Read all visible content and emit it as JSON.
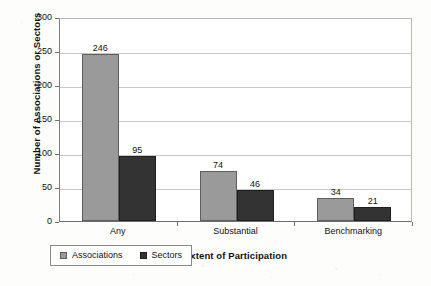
{
  "chart_data": {
    "type": "bar",
    "title": "",
    "categories": [
      "Any",
      "Substantial",
      "Benchmarking"
    ],
    "series": [
      {
        "name": "Associations",
        "values": [
          246,
          74,
          34
        ],
        "color": "#9a9a9a"
      },
      {
        "name": "Sectors",
        "values": [
          95,
          46,
          21
        ],
        "color": "#333333"
      }
    ],
    "xlabel": "Extent of Participation",
    "ylabel": "Number of Associations or Sectors",
    "ylim": [
      0,
      300
    ],
    "ytick_labels": [
      "0",
      "50",
      "100",
      "150",
      "200",
      "250",
      "300"
    ],
    "ytick_values": [
      0,
      50,
      100,
      150,
      200,
      250,
      300
    ],
    "grid": "horizontal",
    "legend_position": "bottom-left",
    "data_labels": [
      "246",
      "95",
      "74",
      "46",
      "34",
      "21"
    ]
  }
}
